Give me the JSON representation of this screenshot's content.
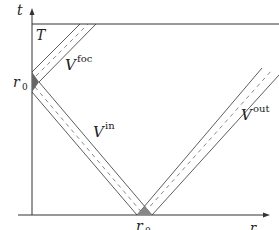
{
  "diagram": {
    "type": "spacetime diagram",
    "axes": {
      "vertical": {
        "label": "t"
      },
      "horizontal": {
        "label": "r"
      }
    },
    "marks": {
      "t_axis_point": "r0",
      "r_axis_point": "r0",
      "horizontal_line": "T"
    },
    "regions": [
      {
        "name": "V",
        "superscript": "foc"
      },
      {
        "name": "V",
        "superscript": "in"
      },
      {
        "name": "V",
        "superscript": "out"
      }
    ],
    "colors": {
      "line": "#333333",
      "shade": "#666666",
      "background": "#ffffff"
    }
  },
  "labels": {
    "t": "t",
    "r": "r",
    "T": "T",
    "r0_sub": "0",
    "V": "V",
    "foc": "foc",
    "in": "in",
    "out": "out"
  }
}
